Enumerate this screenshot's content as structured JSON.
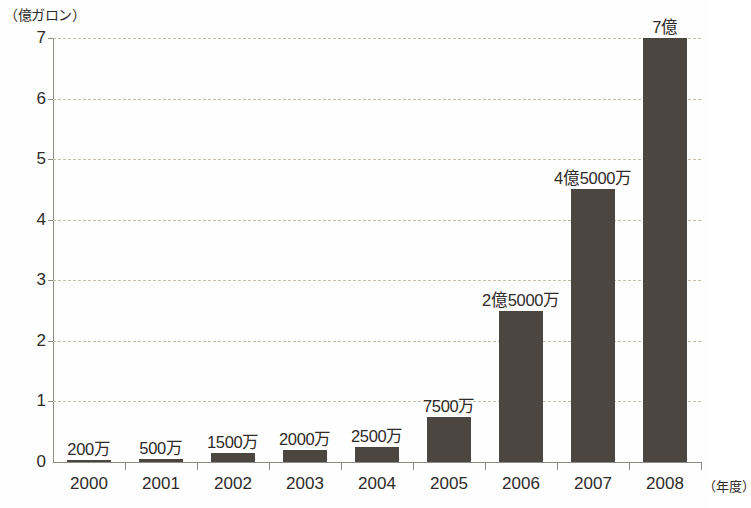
{
  "chart_data": {
    "type": "bar",
    "title": "",
    "subtitle": "",
    "xlabel": "（年度）",
    "ylabel": "（億ガロン）",
    "ylim": [
      0,
      7
    ],
    "ytick_values": [
      0,
      1,
      2,
      3,
      4,
      5,
      6,
      7
    ],
    "ytick_labels": [
      "0",
      "1",
      "2",
      "3",
      "4",
      "5",
      "6",
      "7"
    ],
    "grid": true,
    "gridlines_at": [
      1,
      2,
      3,
      4,
      5,
      6,
      7
    ],
    "legend": null,
    "legend_position": "none",
    "categories": [
      "2000",
      "2001",
      "2002",
      "2003",
      "2004",
      "2005",
      "2006",
      "2007",
      "2008"
    ],
    "values": [
      0.02,
      0.05,
      0.15,
      0.2,
      0.25,
      0.75,
      2.5,
      4.5,
      7.0
    ],
    "data_labels": [
      "200万",
      "500万",
      "1500万",
      "2000万",
      "2500万",
      "7500万",
      "2億5000万",
      "4億5000万",
      "7億"
    ],
    "series": [
      {
        "name": "エタノール生産量",
        "values": [
          0.02,
          0.05,
          0.15,
          0.2,
          0.25,
          0.75,
          2.5,
          4.5,
          7.0
        ]
      }
    ],
    "bar_color": "#4b463f",
    "grid_color": "#c6bda8",
    "axis_color": "#8e8a84",
    "background_color": "#fefefe"
  }
}
